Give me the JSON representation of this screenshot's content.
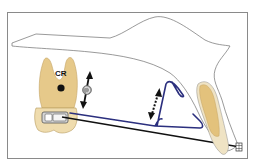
{
  "figure": {
    "type": "orthodontic biomechanics diagram",
    "labels": {
      "center_of_resistance": "CR"
    },
    "elements": [
      {
        "name": "maxilla-outline",
        "description": "thin grey outline of maxillary bone / palate"
      },
      {
        "name": "molar",
        "description": "tan molar tooth with two roots"
      },
      {
        "name": "center-of-resistance-dot",
        "description": "black dot labeled CR"
      },
      {
        "name": "molar-tube",
        "description": "rectangular bracket/tube on molar crown"
      },
      {
        "name": "vertical-force-arrow",
        "description": "double-headed solid arrow with rotation symbol"
      },
      {
        "name": "rotation-symbol",
        "description": "grey circle with curved arrow"
      },
      {
        "name": "archwire",
        "description": "black straight wire from molar tube to incisor"
      },
      {
        "name": "blue-spring",
        "description": "dark blue looped wire / cantilever spring"
      },
      {
        "name": "dashed-activation-arrow",
        "description": "double-headed dotted arrow showing spring activation"
      },
      {
        "name": "incisor",
        "description": "tan elongated incisor tooth"
      },
      {
        "name": "incisor-bracket",
        "description": "small bracket on incisor at wire end"
      }
    ]
  },
  "colors": {
    "tooth_fill": "#e6c98a",
    "tooth_stroke": "#b79a5c",
    "crown_fill": "#efdcae",
    "outline": "#6e6e6e",
    "wire": "#111111",
    "spring": "#2b2f7e",
    "frame": "#8a8a8a"
  }
}
